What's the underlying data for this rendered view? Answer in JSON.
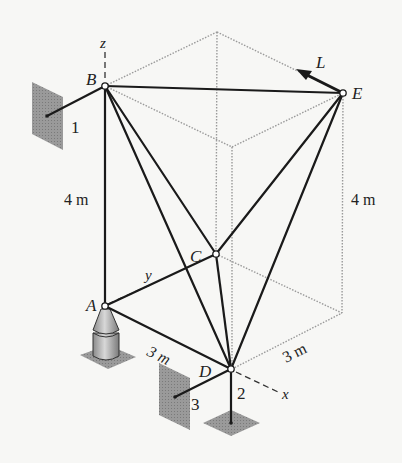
{
  "figure": {
    "type": "space-truss-diagram"
  },
  "axes": {
    "x": "x",
    "y": "y",
    "z": "z"
  },
  "joints": {
    "A": "A",
    "B": "B",
    "C": "C",
    "D": "D",
    "E": "E"
  },
  "links": {
    "link1": "1",
    "link2": "2",
    "link3": "3"
  },
  "load": {
    "label": "L"
  },
  "dimensions": {
    "height_left": "4 m",
    "height_right": "4 m",
    "AD": "3 m",
    "D_to_corner": "3 m"
  },
  "colors": {
    "member": "#1a1a1a",
    "hidden_edge": "#9a9a9a",
    "plate": "#8c8c8c",
    "background": "#f7f7f5"
  }
}
